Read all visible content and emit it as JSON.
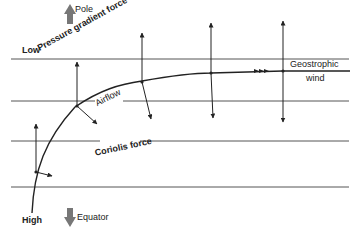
{
  "diagram": {
    "labels": {
      "low": "Low",
      "high": "High",
      "pole": "Pole",
      "equator": "Equator",
      "pressure_gradient_force": "Pressure gradient force",
      "coriolis_force": "Coriolis force",
      "airflow": "Airflow",
      "geostrophic_wind_line1": "Geostrophic",
      "geostrophic_wind_line2": "wind"
    },
    "isobars_y": [
      59,
      101,
      141,
      187
    ],
    "colors": {
      "line": "#222222",
      "isobar": "#555555",
      "direction_arrow": "#777777"
    }
  }
}
